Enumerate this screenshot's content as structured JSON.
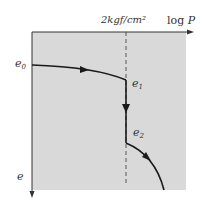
{
  "diagram": {
    "x_axis_label": "log P",
    "x_axis_label_log": "log",
    "x_axis_label_var": "P",
    "y_axis_label": "e",
    "pressure_marker": "2kgf/cm²",
    "points": [
      {
        "name": "e0",
        "base": "e",
        "sub": "0"
      },
      {
        "name": "e1",
        "base": "e",
        "sub": "1"
      },
      {
        "name": "e2",
        "base": "e",
        "sub": "2"
      }
    ],
    "colors": {
      "panel": "#d9d9d9",
      "curve": "#1a1a1a",
      "axis": "#333333",
      "dashed": "#555555"
    }
  }
}
